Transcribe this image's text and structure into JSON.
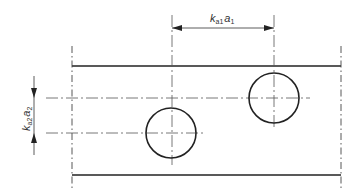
{
  "diagram": {
    "type": "technical-drawing",
    "colors": {
      "line": "#222222",
      "thin": "#555555",
      "background": "#ffffff"
    },
    "dimensions": {
      "horizontal": {
        "symbol": "k",
        "sub1": "a1",
        "var": "a",
        "sub2": "1"
      },
      "vertical": {
        "symbol": "k",
        "sub1": "a2",
        "var": "a",
        "sub2": "2"
      }
    },
    "holes": [
      {
        "name": "hole-1",
        "cx": 171,
        "cy": 133,
        "r": 25
      },
      {
        "name": "hole-2",
        "cx": 274,
        "cy": 98,
        "r": 25
      }
    ]
  }
}
